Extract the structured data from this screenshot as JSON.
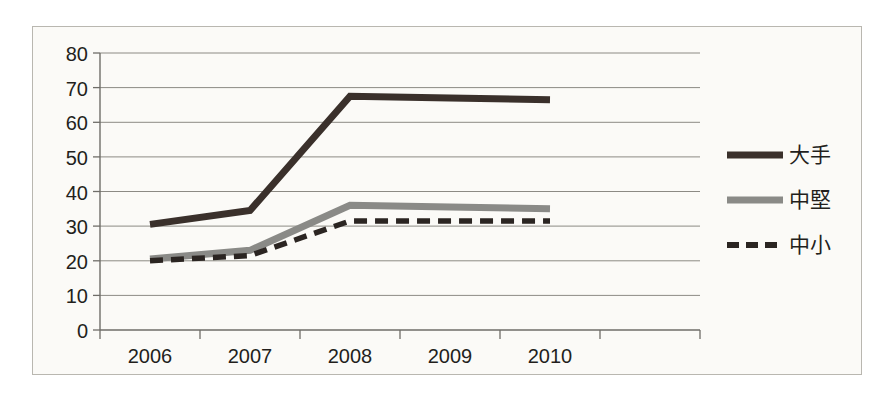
{
  "chart_data": {
    "type": "line",
    "title": "",
    "subtitle": "",
    "xlabel": "",
    "ylabel": "",
    "categories": [
      "2006",
      "2007",
      "2008",
      "2009",
      "2010"
    ],
    "ylim": [
      0,
      80
    ],
    "y_ticks": [
      0,
      10,
      20,
      30,
      40,
      50,
      60,
      70,
      80
    ],
    "grid": true,
    "legend_position": "right",
    "series": [
      {
        "name": "大手",
        "style": "solid",
        "color": "#3a302b",
        "values": [
          30.5,
          34.5,
          67.5,
          67.0,
          66.5
        ]
      },
      {
        "name": "中堅",
        "style": "solid",
        "color": "#8a8a87",
        "values": [
          20.5,
          23.0,
          36.0,
          35.5,
          35.0
        ]
      },
      {
        "name": "中小",
        "style": "dashed",
        "color": "#2b2522",
        "values": [
          20.0,
          21.5,
          31.5,
          31.5,
          31.5
        ]
      }
    ]
  },
  "colors": {
    "background": "#fbfaf7",
    "frame_border": "#b9b7b0",
    "gridline": "#8c8a84",
    "axis": "#6f6d68",
    "text": "#231f1c",
    "series_large": "#3a302b",
    "series_medium": "#8a8a87",
    "series_small": "#2b2522"
  },
  "axis": {
    "y_labels": [
      "80",
      "70",
      "60",
      "50",
      "40",
      "30",
      "20",
      "10",
      "0"
    ],
    "x_labels": [
      "2006",
      "2007",
      "2008",
      "2009",
      "2010"
    ]
  },
  "legend": {
    "items": [
      {
        "label": "大手",
        "swatch": "solid-dark-line"
      },
      {
        "label": "中堅",
        "swatch": "solid-gray-line"
      },
      {
        "label": "中小",
        "swatch": "dashed-dark-line"
      }
    ]
  }
}
